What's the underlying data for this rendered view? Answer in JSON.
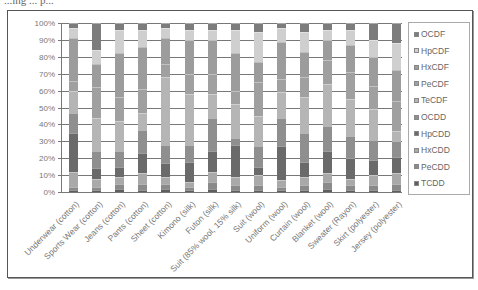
{
  "page": {
    "top_text_fragment": "...ing ... p..."
  },
  "chart_data": {
    "type": "bar",
    "stacked": true,
    "normalized_percent": true,
    "title": "",
    "xlabel": "",
    "ylabel": "",
    "ylim": [
      0,
      100
    ],
    "y_ticks": [
      "0%",
      "10%",
      "20%",
      "30%",
      "40%",
      "50%",
      "60%",
      "70%",
      "80%",
      "90%",
      "100%"
    ],
    "grid": true,
    "legend_position": "right",
    "categories": [
      "Underwear (cotton)",
      "Sports Wear (cotton)",
      "Jeans (cotton)",
      "Pants (cotton)",
      "Sheet (cotton)",
      "Kimono (silk)",
      "Futon (silk)",
      "Suit (85% wool, 15% silk)",
      "Suit (wool)",
      "Uniform (wool)",
      "Curtain (wool)",
      "Blanket (wool)",
      "Sweater (Rayon)",
      "Skirt (polyester)",
      "Jersey (polyester)"
    ],
    "series": [
      {
        "name": "TCDD",
        "color": "#5e5e5e",
        "values": [
          1,
          1,
          2,
          1,
          2,
          1,
          2,
          1,
          1,
          1,
          1,
          2,
          1,
          1,
          1
        ]
      },
      {
        "name": "PeCDD",
        "color": "#8a8a8a",
        "values": [
          2,
          2,
          3,
          4,
          3,
          2,
          4,
          3,
          3,
          2,
          3,
          4,
          3,
          3,
          4
        ]
      },
      {
        "name": "HxCDD",
        "color": "#a9a9a9",
        "values": [
          9,
          5,
          4,
          6,
          4,
          3,
          6,
          5,
          6,
          4,
          5,
          5,
          4,
          6,
          6
        ]
      },
      {
        "name": "HpCDD",
        "color": "#6a6a6a",
        "values": [
          23,
          6,
          6,
          12,
          8,
          12,
          12,
          19,
          5,
          20,
          9,
          13,
          12,
          9,
          10
        ]
      },
      {
        "name": "OCDD",
        "color": "#8f8f8f",
        "values": [
          12,
          10,
          9,
          14,
          11,
          10,
          20,
          4,
          12,
          17,
          17,
          15,
          13,
          12,
          9
        ]
      },
      {
        "name": "TeCDF",
        "color": "#b5b5b5",
        "values": [
          13,
          20,
          18,
          10,
          40,
          30,
          14,
          20,
          18,
          15,
          21,
          25,
          22,
          18,
          6
        ]
      },
      {
        "name": "PeCDF",
        "color": "#a0a0a0",
        "values": [
          6,
          18,
          14,
          14,
          8,
          12,
          12,
          8,
          20,
          8,
          12,
          14,
          16,
          14,
          18
        ]
      },
      {
        "name": "HxCDF",
        "color": "#9c9c9c",
        "values": [
          25,
          14,
          26,
          25,
          15,
          20,
          20,
          22,
          12,
          22,
          15,
          12,
          16,
          17,
          18
        ]
      },
      {
        "name": "HpCDF",
        "color": "#cfcfcf",
        "values": [
          6,
          8,
          14,
          10,
          6,
          6,
          6,
          14,
          18,
          8,
          12,
          6,
          9,
          10,
          16
        ]
      },
      {
        "name": "OCDF",
        "color": "#7c7c7c",
        "values": [
          3,
          16,
          4,
          4,
          3,
          4,
          4,
          4,
          5,
          3,
          5,
          4,
          4,
          10,
          12
        ]
      }
    ]
  },
  "legend": {
    "items": [
      "OCDF",
      "HpCDF",
      "HxCDF",
      "PeCDF",
      "TeCDF",
      "OCDD",
      "HpCDD",
      "HxCDD",
      "PeCDD",
      "TCDD"
    ]
  }
}
